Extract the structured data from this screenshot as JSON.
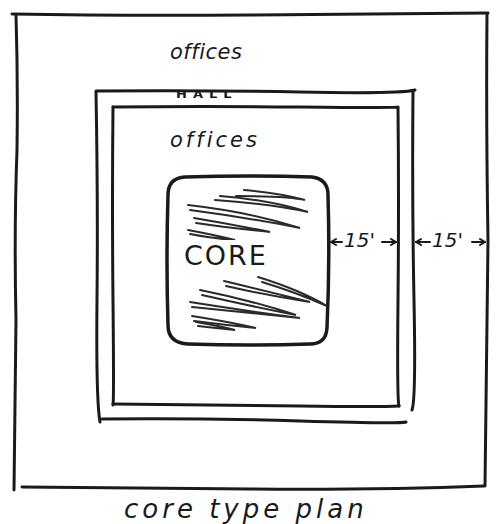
{
  "diagram": {
    "type": "hand-drawn architectural floor plan sketch",
    "labels": {
      "outer_offices": "offices",
      "hall": "HALL",
      "inner_offices": "offices",
      "core": "CORE",
      "dimension_inner": "15'",
      "dimension_outer": "15'",
      "caption": "core type plan"
    },
    "zones": [
      {
        "name": "outer offices ring",
        "label": "offices"
      },
      {
        "name": "hall corridor ring",
        "label": "HALL"
      },
      {
        "name": "inner offices ring",
        "label": "offices"
      },
      {
        "name": "central core",
        "label": "CORE",
        "hatched": true
      }
    ],
    "dimensions": [
      {
        "from": "core edge",
        "to": "hall inner wall",
        "value": "15'"
      },
      {
        "from": "hall outer wall",
        "to": "building exterior",
        "value": "15'"
      }
    ],
    "colors": {
      "ink": "#1a1a1a",
      "paper": "#ffffff"
    }
  }
}
